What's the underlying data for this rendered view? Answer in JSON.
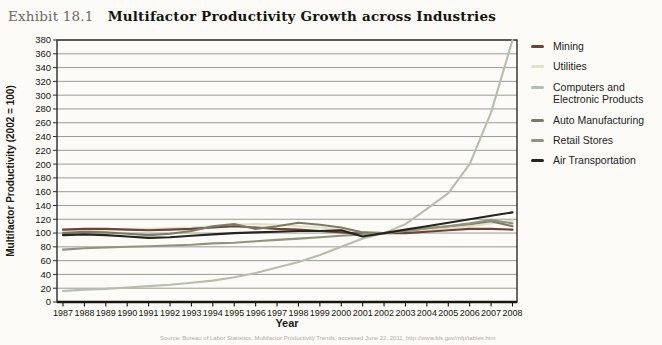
{
  "header": {
    "exhibit_label": "Exhibit 18.1",
    "title": "Multifactor Productivity Growth across Industries"
  },
  "chart_data": {
    "type": "line",
    "title": "Multifactor Productivity Growth across Industries",
    "xlabel": "Year",
    "ylabel": "Multifactor Productivity (2002 = 100)",
    "x": [
      1987,
      1988,
      1989,
      1990,
      1991,
      1992,
      1993,
      1994,
      1995,
      1996,
      1997,
      1998,
      1999,
      2000,
      2001,
      2002,
      2003,
      2004,
      2005,
      2006,
      2007,
      2008
    ],
    "ylim": [
      0,
      380
    ],
    "ytick_step": 20,
    "grid": true,
    "legend_position": "right-outside",
    "series": [
      {
        "name": "Mining",
        "color": "#6d4238",
        "values": [
          105,
          106,
          106,
          105,
          104,
          105,
          106,
          108,
          110,
          108,
          106,
          105,
          103,
          101,
          99,
          100,
          100,
          102,
          104,
          106,
          106,
          105
        ]
      },
      {
        "name": "Utilities",
        "color": "#e6e0c2",
        "values": [
          103,
          104,
          105,
          106,
          106,
          107,
          108,
          110,
          112,
          113,
          112,
          110,
          108,
          105,
          102,
          100,
          102,
          104,
          107,
          110,
          114,
          118
        ]
      },
      {
        "name": "Computers and Electronic Products",
        "color": "#b7beae",
        "values": [
          16,
          18,
          19,
          21,
          23,
          25,
          28,
          31,
          36,
          42,
          50,
          58,
          68,
          80,
          92,
          100,
          113,
          135,
          158,
          200,
          275,
          380
        ]
      },
      {
        "name": "Auto Manufacturing",
        "color": "#7b7c66",
        "values": [
          100,
          102,
          101,
          99,
          97,
          99,
          103,
          110,
          113,
          106,
          110,
          115,
          112,
          108,
          101,
          100,
          103,
          107,
          110,
          113,
          117,
          110
        ]
      },
      {
        "name": "Retail Stores",
        "color": "#8e947e",
        "values": [
          76,
          78,
          79,
          80,
          81,
          82,
          83,
          85,
          86,
          88,
          90,
          92,
          94,
          96,
          98,
          100,
          103,
          107,
          110,
          114,
          119,
          114
        ]
      },
      {
        "name": "Air Transportation",
        "color": "#24251f",
        "values": [
          97,
          98,
          97,
          95,
          93,
          94,
          96,
          98,
          100,
          101,
          102,
          103,
          103,
          104,
          95,
          100,
          105,
          110,
          115,
          120,
          125,
          130
        ]
      }
    ],
    "draw_order": [
      1,
      0,
      3,
      4,
      2,
      5
    ],
    "axis_color": "#2b2b28",
    "grid_color": "#8f8f8c"
  },
  "footer": {
    "source": "Source: Bureau of Labor Statistics, Multifactor Productivity Trends, accessed June 22, 2011, http://www.bls.gov/mfp/tables.htm"
  }
}
